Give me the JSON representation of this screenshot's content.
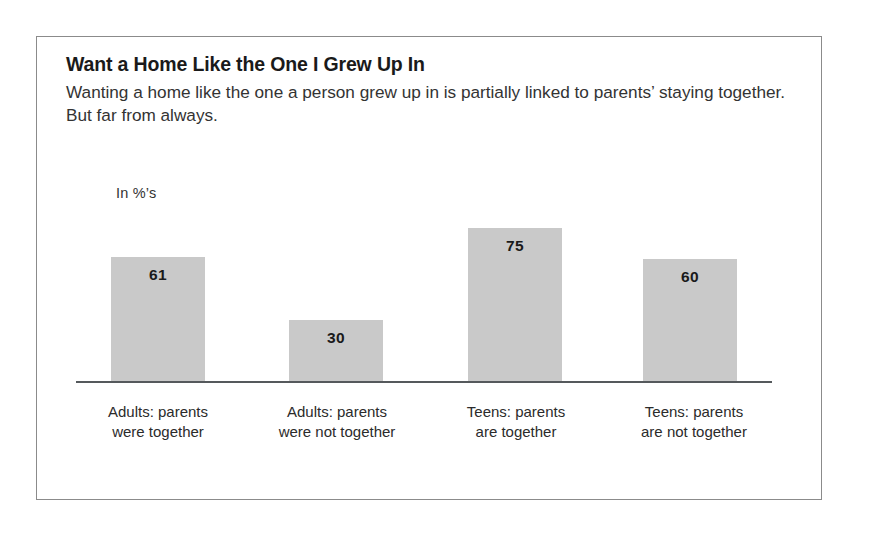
{
  "figure": {
    "title": "Want a Home Like the One I Grew Up In",
    "subtitle": "Wanting a home like the one a person grew up in is partially linked to parents’ staying together. But far from always.",
    "units_label": "In %’s",
    "border_color": "#8b8b8b",
    "background_color": "#ffffff"
  },
  "chart_data": {
    "type": "bar",
    "title": "Want a Home Like the One I Grew Up In",
    "subtitle": "Wanting a home like the one a person grew up in is partially linked to parents’ staying together. But far from always.",
    "categories": [
      "Adults: parents were together",
      "Adults: parents were not together",
      "Teens: parents are together",
      "Teens: parents are not together"
    ],
    "category_lines": [
      [
        "Adults: parents",
        "were together"
      ],
      [
        "Adults: parents",
        "were not together"
      ],
      [
        "Teens: parents",
        "are together"
      ],
      [
        "Teens: parents",
        "are not together"
      ]
    ],
    "values": [
      61,
      30,
      75,
      60
    ],
    "value_labels": [
      "61",
      "30",
      "75",
      "60"
    ],
    "xlabel": "",
    "ylabel": "In %’s",
    "ylim": [
      0,
      85
    ],
    "grid": false,
    "legend": false,
    "bar_color": "#c9c9c9",
    "axis_color": "#55595c"
  }
}
